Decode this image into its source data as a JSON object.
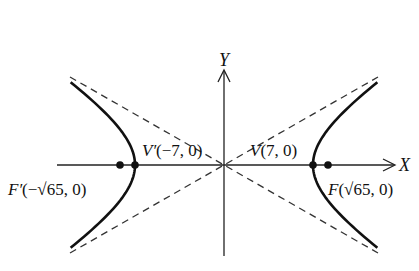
{
  "diagram": {
    "type": "hyperbola",
    "equation_params": {
      "a": 7,
      "b": 4,
      "c": "sqrt(65)"
    },
    "axes": {
      "x_label": "X",
      "y_label": "Y"
    },
    "points": [
      {
        "id": "vertex-left",
        "label_name": "V′",
        "label_coord": "(−7, 0)",
        "x": -7,
        "y": 0
      },
      {
        "id": "vertex-right",
        "label_name": "V",
        "label_coord": "(7, 0)",
        "x": 7,
        "y": 0
      },
      {
        "id": "focus-left",
        "label_name": "F′",
        "label_coord": "(−√65, 0)",
        "x": -8.062,
        "y": 0
      },
      {
        "id": "focus-right",
        "label_name": "F",
        "label_coord": "(√65, 0)",
        "x": 8.062,
        "y": 0
      }
    ],
    "asymptotes": [
      "y = 4x/7",
      "y = −4x/7"
    ],
    "colors": {
      "curve": "#111111",
      "asymptote": "#333333",
      "axis": "#222222"
    }
  }
}
